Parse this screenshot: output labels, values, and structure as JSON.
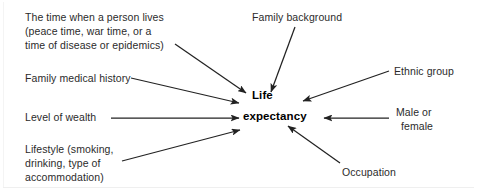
{
  "diagram": {
    "center": {
      "name": "center-node",
      "line1": "Life",
      "line2": "expectancy"
    },
    "colors": {
      "arrow": "#222222",
      "text": "#2b2b2b",
      "center_text": "#000000",
      "background": "#ffffff",
      "frame": "#efefef"
    },
    "factors": [
      {
        "id": "time-period",
        "lines": [
          "The time when a person lives",
          "(peace time, war time, or a",
          "time of disease or epidemics)"
        ],
        "position": "top-left"
      },
      {
        "id": "family-medical-history",
        "lines": [
          "Family medical history"
        ],
        "position": "left-upper"
      },
      {
        "id": "level-of-wealth",
        "lines": [
          "Level of wealth"
        ],
        "position": "left-middle"
      },
      {
        "id": "lifestyle",
        "lines": [
          "Lifestyle (smoking,",
          "drinking, type of",
          "accommodation)"
        ],
        "position": "bottom-left"
      },
      {
        "id": "family-background",
        "lines": [
          "Family background"
        ],
        "position": "top-center"
      },
      {
        "id": "ethnic-group",
        "lines": [
          "Ethnic group"
        ],
        "position": "right-upper"
      },
      {
        "id": "male-or-female",
        "lines": [
          "Male or",
          "female"
        ],
        "position": "right-middle"
      },
      {
        "id": "occupation",
        "lines": [
          "Occupation"
        ],
        "position": "bottom-right"
      }
    ],
    "connectors": [
      {
        "from": "time-period",
        "to": "center-node",
        "arrowhead": true
      },
      {
        "from": "family-medical-history",
        "to": "center-node",
        "arrowhead": true
      },
      {
        "from": "level-of-wealth",
        "to": "center-node",
        "arrowhead": true
      },
      {
        "from": "lifestyle",
        "to": "center-node",
        "arrowhead": true
      },
      {
        "from": "family-background",
        "to": "center-node",
        "arrowhead": true
      },
      {
        "from": "ethnic-group",
        "to": "center-node",
        "arrowhead": true
      },
      {
        "from": "male-or-female",
        "to": "center-node",
        "arrowhead": true
      },
      {
        "from": "occupation",
        "to": "center-node",
        "arrowhead": true
      }
    ]
  }
}
